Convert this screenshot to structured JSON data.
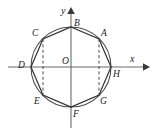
{
  "figure": {
    "colors": {
      "background": "#ffffff",
      "axis": "#6b6b6b",
      "arrow": "#3a3a3a",
      "circle": "#4a4a4a",
      "polygon": "#2e2e2e",
      "dashed": "#4a4a4a",
      "label": "#1b1b1b"
    },
    "geometry": {
      "center": {
        "x": 71,
        "y": 67
      },
      "radius": 40,
      "x_axis": {
        "x1": 8,
        "y1": 67,
        "x2": 146,
        "y2": 67
      },
      "y_axis": {
        "x1": 71,
        "y1": 128,
        "x2": 71,
        "y2": 10
      },
      "octagon_vertices": [
        {
          "name": "B",
          "x": 71,
          "y": 27
        },
        {
          "name": "A",
          "x": 99,
          "y": 39
        },
        {
          "name": "H",
          "x": 111,
          "y": 67
        },
        {
          "name": "G",
          "x": 99,
          "y": 95
        },
        {
          "name": "F",
          "x": 71,
          "y": 107
        },
        {
          "name": "E",
          "x": 43,
          "y": 95
        },
        {
          "name": "D",
          "x": 31,
          "y": 67
        },
        {
          "name": "C",
          "x": 43,
          "y": 39
        }
      ],
      "dashed_chords": [
        {
          "from": "C",
          "to": "E",
          "x": 43,
          "y1": 39,
          "y2": 95
        },
        {
          "from": "A",
          "to": "G",
          "x": 99,
          "y1": 39,
          "y2": 95
        }
      ]
    },
    "axis_labels": [
      {
        "id": "x-axis-label",
        "text": "x",
        "x": 130,
        "y": 54
      },
      {
        "id": "y-axis-label",
        "text": "y",
        "x": 61,
        "y": 6
      }
    ],
    "point_labels": [
      {
        "id": "point-a",
        "text": "A",
        "x": 101,
        "y": 29
      },
      {
        "id": "point-b",
        "text": "B",
        "x": 74,
        "y": 19
      },
      {
        "id": "point-c",
        "text": "C",
        "x": 32,
        "y": 29
      },
      {
        "id": "point-d",
        "text": "D",
        "x": 18,
        "y": 61
      },
      {
        "id": "point-e",
        "text": "E",
        "x": 34,
        "y": 97
      },
      {
        "id": "point-f",
        "text": "F",
        "x": 73,
        "y": 110
      },
      {
        "id": "point-g",
        "text": "G",
        "x": 100,
        "y": 97
      },
      {
        "id": "point-h",
        "text": "H",
        "x": 113,
        "y": 70
      },
      {
        "id": "point-o",
        "text": "O",
        "x": 62,
        "y": 57
      }
    ]
  }
}
